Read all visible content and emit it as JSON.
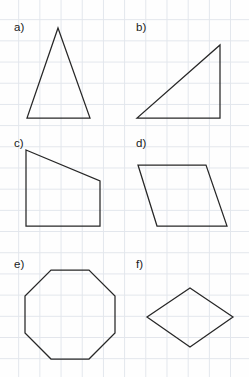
{
  "page": {
    "background_color": "#fefefe",
    "grid_color": "#e2e6ec",
    "grid_spacing_px": 21,
    "stroke_color": "#272727",
    "width": 249,
    "height": 377
  },
  "shapes": [
    {
      "label": "a)",
      "name": "triangle-isosceles",
      "kind": "triangle",
      "points": "58,28 90,118 27,118"
    },
    {
      "label": "b)",
      "name": "triangle-right",
      "kind": "triangle",
      "points": "220,45 220,118 137,118"
    },
    {
      "label": "c)",
      "name": "trapezoid-right",
      "kind": "trapezoid",
      "points": "26,150 100,181 100,226 26,226"
    },
    {
      "label": "d)",
      "name": "parallelogram",
      "kind": "parallelogram",
      "points": "138,165 206,165 227,226 157,226"
    },
    {
      "label": "e)",
      "name": "octagon",
      "kind": "octagon",
      "points": "51,270 89,270 115,296 115,333 89,359 51,359 25,333 25,296"
    },
    {
      "label": "f)",
      "name": "rhombus",
      "kind": "rhombus",
      "points": "190,288 233,317 190,347 147,317"
    }
  ]
}
